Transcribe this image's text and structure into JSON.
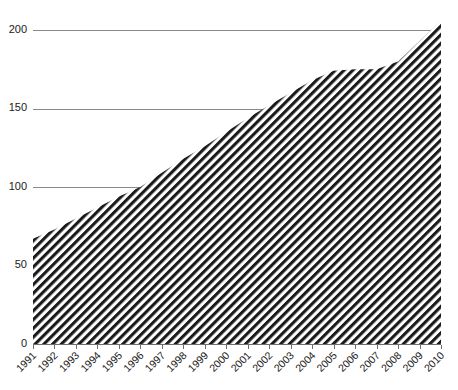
{
  "chart_data": {
    "type": "area",
    "title": "",
    "subtitle": "",
    "xlabel": "",
    "ylabel": "",
    "categories": [
      "1991",
      "1992",
      "1993",
      "1994",
      "1995",
      "1996",
      "1997",
      "1998",
      "1999",
      "2000",
      "2001",
      "2002",
      "2003",
      "2004",
      "2005",
      "2006",
      "2007",
      "2008",
      "2009",
      "2010"
    ],
    "values": [
      67,
      73,
      80,
      87,
      94,
      100,
      109,
      118,
      126,
      135,
      144,
      152,
      160,
      168,
      174,
      175,
      175,
      180,
      193,
      206
    ],
    "series": [
      {
        "name": "",
        "values": [
          67,
          73,
          80,
          87,
          94,
          100,
          109,
          118,
          126,
          135,
          144,
          152,
          160,
          168,
          174,
          175,
          175,
          180,
          193,
          206
        ]
      }
    ],
    "ylim": [
      0,
      210
    ],
    "y_ticks": [
      0,
      50,
      100,
      150,
      200
    ],
    "y_tick_labels": [
      "0",
      "50",
      "100",
      "150",
      "200"
    ],
    "xlim": [
      "1991",
      "2010"
    ],
    "grid": "horizontal",
    "legend": "none",
    "fill_pattern": "diagonal-hatch",
    "colors": {
      "hatch_stroke": "#1a1a1a",
      "hatch_background": "#ffffff",
      "gridline": "#8a8a8a",
      "axis": "#6e6e6e",
      "text": "#1a1a1a",
      "plot_background": "#ffffff"
    },
    "x_label_rotation_deg": 45
  },
  "axes": {
    "y_axis_name": "value-axis",
    "x_axis_name": "year-axis"
  }
}
